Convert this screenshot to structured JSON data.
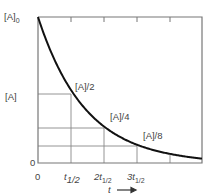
{
  "chart_data": {
    "type": "line",
    "title": "",
    "xlabel": "t",
    "ylabel": "[A]",
    "x_ticks": [
      "0",
      "t1/2",
      "2t1/2",
      "3t1/2"
    ],
    "y_ticks": [
      "0",
      "[A]0"
    ],
    "series": [
      {
        "name": "[A] first-order decay",
        "x": [
          0,
          1,
          2,
          3,
          4,
          5
        ],
        "values": [
          1,
          0.5,
          0.25,
          0.125,
          0.0625,
          0.03125
        ]
      }
    ],
    "annotations": [
      "[A]/2",
      "[A]/4",
      "[A]/8"
    ],
    "x_unit": "half-lives",
    "xlim": [
      0,
      5
    ],
    "ylim": [
      0,
      1
    ],
    "grid": "guide lines at each half-life",
    "colors": {
      "curve": "#111111",
      "axes": "#777777",
      "grid": "#888888",
      "text": "#444444"
    }
  },
  "labels": {
    "y_top": "[A]",
    "y_top_sub": "0",
    "y_mid": "[A]",
    "y_zero": "0",
    "x_zero": "0",
    "x_t1": "t",
    "x_t1_sub": "1/2",
    "x_t2_pre": "2t",
    "x_t2_sub": "1/2",
    "x_t3_pre": "3t",
    "x_t3_sub": "1/2",
    "x_axis": "t",
    "ann_half": "[A]/2",
    "ann_quarter": "[A]/4",
    "ann_eighth": "[A]/8"
  }
}
